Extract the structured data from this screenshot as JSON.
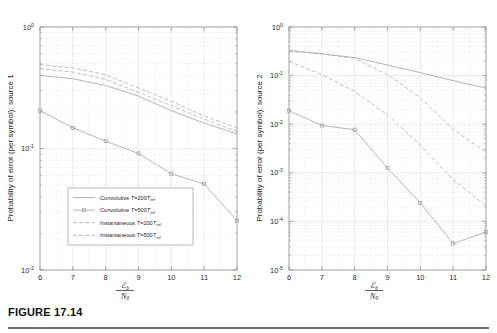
{
  "figure": {
    "caption_label": "FIGURE 17.14"
  },
  "chart_data": [
    {
      "type": "line",
      "id": "panel-left",
      "title": "",
      "xlabel": "E_b / N_0",
      "xlabel_numerator": "ℰ",
      "xlabel_numerator_sub": "b",
      "xlabel_denominator": "N",
      "xlabel_denominator_sub": "0",
      "ylabel": "Probability of error (per symbol): source 1",
      "xlim": [
        6,
        12
      ],
      "ylim": [
        0.01,
        1
      ],
      "yscale": "log",
      "grid": true,
      "xticks": [
        "6",
        "7",
        "8",
        "9",
        "10",
        "11",
        "12"
      ],
      "yticks": [
        "10",
        "10",
        "10"
      ],
      "ytick_exponents": [
        "0",
        "-1",
        "-2"
      ],
      "ytick_values": [
        1,
        0.1,
        0.01
      ],
      "x": [
        6,
        7,
        8,
        9,
        10,
        11,
        12
      ],
      "series": [
        {
          "name": "Convolutive T=200Tref",
          "style": "solid",
          "markers": false,
          "values": [
            0.4,
            0.375,
            0.33,
            0.27,
            0.205,
            0.162,
            0.132
          ]
        },
        {
          "name": "Convolutive T=500Tref",
          "style": "solid",
          "markers": true,
          "values": [
            0.205,
            0.148,
            0.115,
            0.091,
            0.062,
            0.051,
            0.0255
          ]
        },
        {
          "name": "Instantaneous T=200Tref",
          "style": "dashed",
          "markers": false,
          "values": [
            0.455,
            0.425,
            0.37,
            0.29,
            0.225,
            0.175,
            0.138
          ]
        },
        {
          "name": "Instantaneous T=500Tref",
          "style": "dashed",
          "markers": false,
          "values": [
            0.49,
            0.46,
            0.405,
            0.315,
            0.245,
            0.185,
            0.148
          ]
        }
      ],
      "legend": {
        "position": "lower-center",
        "entries": [
          {
            "prefix": "Convolutive ",
            "sym": "T",
            "eq": "=200",
            "sym2": "T",
            "sub": "ref",
            "style": "solid",
            "markers": false
          },
          {
            "prefix": "Convolutive ",
            "sym": "T",
            "eq": "=500",
            "sym2": "T",
            "sub": "ref",
            "style": "solid",
            "markers": true
          },
          {
            "prefix": "Instantaneous ",
            "sym": "T",
            "eq": "=200",
            "sym2": "T",
            "sub": "ref",
            "style": "dashed",
            "markers": false
          },
          {
            "prefix": "Instantaneous ",
            "sym": "T",
            "eq": "=500",
            "sym2": "T",
            "sub": "ref",
            "style": "dashed",
            "markers": false
          }
        ]
      }
    },
    {
      "type": "line",
      "id": "panel-right",
      "title": "",
      "xlabel": "E_b / N_0",
      "xlabel_numerator": "ℰ",
      "xlabel_numerator_sub": "b",
      "xlabel_denominator": "N",
      "xlabel_denominator_sub": "0",
      "ylabel": "Probability of error (per symbol): source 2",
      "xlim": [
        6,
        12
      ],
      "ylim": [
        1e-05,
        1
      ],
      "yscale": "log",
      "grid": true,
      "xticks": [
        "6",
        "7",
        "8",
        "9",
        "10",
        "11",
        "12"
      ],
      "yticks": [
        "10",
        "10",
        "10",
        "10",
        "10",
        "10"
      ],
      "ytick_exponents": [
        "0",
        "-1",
        "-2",
        "-3",
        "-4",
        "-5"
      ],
      "ytick_values": [
        1,
        0.1,
        0.01,
        0.001,
        0.0001,
        1e-05
      ],
      "x": [
        6,
        7,
        8,
        9,
        10,
        11,
        12
      ],
      "series": [
        {
          "name": "Convolutive T=200Tref",
          "style": "solid",
          "markers": false,
          "values": [
            0.33,
            0.28,
            0.235,
            0.165,
            0.115,
            0.079,
            0.055
          ]
        },
        {
          "name": "Convolutive T=500Tref",
          "style": "solid",
          "markers": true,
          "values": [
            0.019,
            0.0094,
            0.0077,
            0.00125,
            0.00024,
            3.5e-05,
            6e-05
          ]
        },
        {
          "name": "Instantaneous T=200Tref",
          "style": "dashed",
          "markers": false,
          "values": [
            0.32,
            0.28,
            0.225,
            0.105,
            0.035,
            0.0078,
            0.0027
          ]
        },
        {
          "name": "Instantaneous T=500Tref",
          "style": "dashed",
          "markers": false,
          "values": [
            0.195,
            0.105,
            0.047,
            0.0155,
            0.0037,
            0.00072,
            0.00021
          ]
        }
      ],
      "legend": {
        "position": "none",
        "entries": []
      }
    }
  ]
}
